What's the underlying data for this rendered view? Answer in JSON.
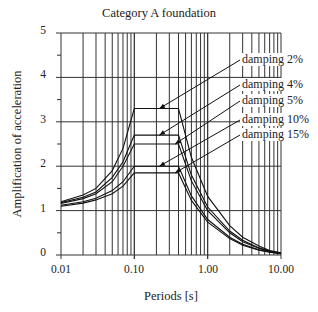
{
  "chart_data": {
    "type": "line",
    "title": "Category A foundation",
    "xlabel": "Periods [s]",
    "ylabel": "Amplification of acceleration",
    "xscale": "log",
    "xlim": [
      0.01,
      10.0
    ],
    "ylim": [
      0,
      5
    ],
    "grid": true,
    "x_tick_labels": [
      "0.01",
      "0.10",
      "1.00",
      "10.00"
    ],
    "y_tick_labels": [
      "0",
      "1",
      "2",
      "3",
      "4",
      "5"
    ],
    "x": [
      0.01,
      0.02,
      0.03,
      0.05,
      0.07,
      0.1,
      0.4,
      0.6,
      1.0,
      2.0,
      3.0,
      5.0,
      7.0,
      10.0
    ],
    "series": [
      {
        "name": "damping 2%",
        "values": [
          1.2,
          1.35,
          1.5,
          1.9,
          2.4,
          3.3,
          3.3,
          2.2,
          1.32,
          0.66,
          0.4,
          0.2,
          0.1,
          0.05
        ]
      },
      {
        "name": "damping 4%",
        "values": [
          1.18,
          1.3,
          1.42,
          1.75,
          2.1,
          2.7,
          2.7,
          1.8,
          1.08,
          0.54,
          0.33,
          0.16,
          0.09,
          0.04
        ]
      },
      {
        "name": "damping 5%",
        "values": [
          1.16,
          1.27,
          1.38,
          1.65,
          2.0,
          2.5,
          2.5,
          1.67,
          1.0,
          0.5,
          0.3,
          0.15,
          0.08,
          0.04
        ]
      },
      {
        "name": "damping 10%",
        "values": [
          1.12,
          1.2,
          1.28,
          1.45,
          1.65,
          2.0,
          2.0,
          1.33,
          0.8,
          0.4,
          0.24,
          0.12,
          0.07,
          0.03
        ]
      },
      {
        "name": "damping 15%",
        "values": [
          1.1,
          1.17,
          1.24,
          1.38,
          1.55,
          1.85,
          1.85,
          1.23,
          0.74,
          0.37,
          0.22,
          0.11,
          0.06,
          0.03
        ]
      }
    ],
    "annotations": [
      {
        "text": "damping 2%",
        "arrow_to": [
          0.22,
          3.3
        ]
      },
      {
        "text": "damping 4%",
        "arrow_to": [
          0.22,
          2.7
        ]
      },
      {
        "text": "damping 5%",
        "arrow_to": [
          0.36,
          2.5
        ]
      },
      {
        "text": "damping 10%",
        "arrow_to": [
          0.22,
          2.0
        ]
      },
      {
        "text": "damping 15%",
        "arrow_to": [
          0.36,
          1.85
        ]
      }
    ]
  }
}
